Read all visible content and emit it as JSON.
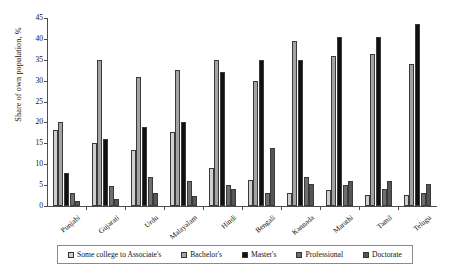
{
  "chart_data": {
    "type": "bar",
    "title": "",
    "xlabel": "",
    "ylabel": "Share of own population, %",
    "ylim": [
      0,
      45
    ],
    "yticks": [
      0,
      5,
      10,
      15,
      20,
      25,
      30,
      35,
      40,
      45
    ],
    "grid": false,
    "legend_position": "bottom",
    "categories": [
      "Punjabi",
      "Gujarati",
      "Urdu",
      "Malayalam",
      "Hindi",
      "Bengali",
      "Kannada",
      "Marathi",
      "Tamil",
      "Telugu"
    ],
    "series": [
      {
        "name": "Some college to Associate's",
        "color": "#cfcfcf",
        "values": [
          18.3,
          15.0,
          13.3,
          17.8,
          9.0,
          6.2,
          3.0,
          3.8,
          2.7,
          2.6
        ]
      },
      {
        "name": "Bachelor's",
        "color": "#a3a3a3",
        "values": [
          20.0,
          35.0,
          31.0,
          32.5,
          35.0,
          30.0,
          39.5,
          36.0,
          36.5,
          34.0
        ]
      },
      {
        "name": "Master's",
        "color": "#111111",
        "values": [
          8.0,
          16.0,
          19.0,
          20.0,
          32.0,
          35.0,
          35.0,
          40.5,
          40.5,
          43.5
        ]
      },
      {
        "name": "Professional",
        "color": "#6e6e6e",
        "values": [
          3.0,
          4.8,
          7.0,
          6.0,
          5.0,
          3.0,
          7.0,
          5.0,
          4.0,
          3.0
        ]
      },
      {
        "name": "Doctorate",
        "color": "#565656",
        "values": [
          1.3,
          1.6,
          3.0,
          2.5,
          4.0,
          14.0,
          5.3,
          6.0,
          6.0,
          5.3
        ]
      }
    ]
  }
}
